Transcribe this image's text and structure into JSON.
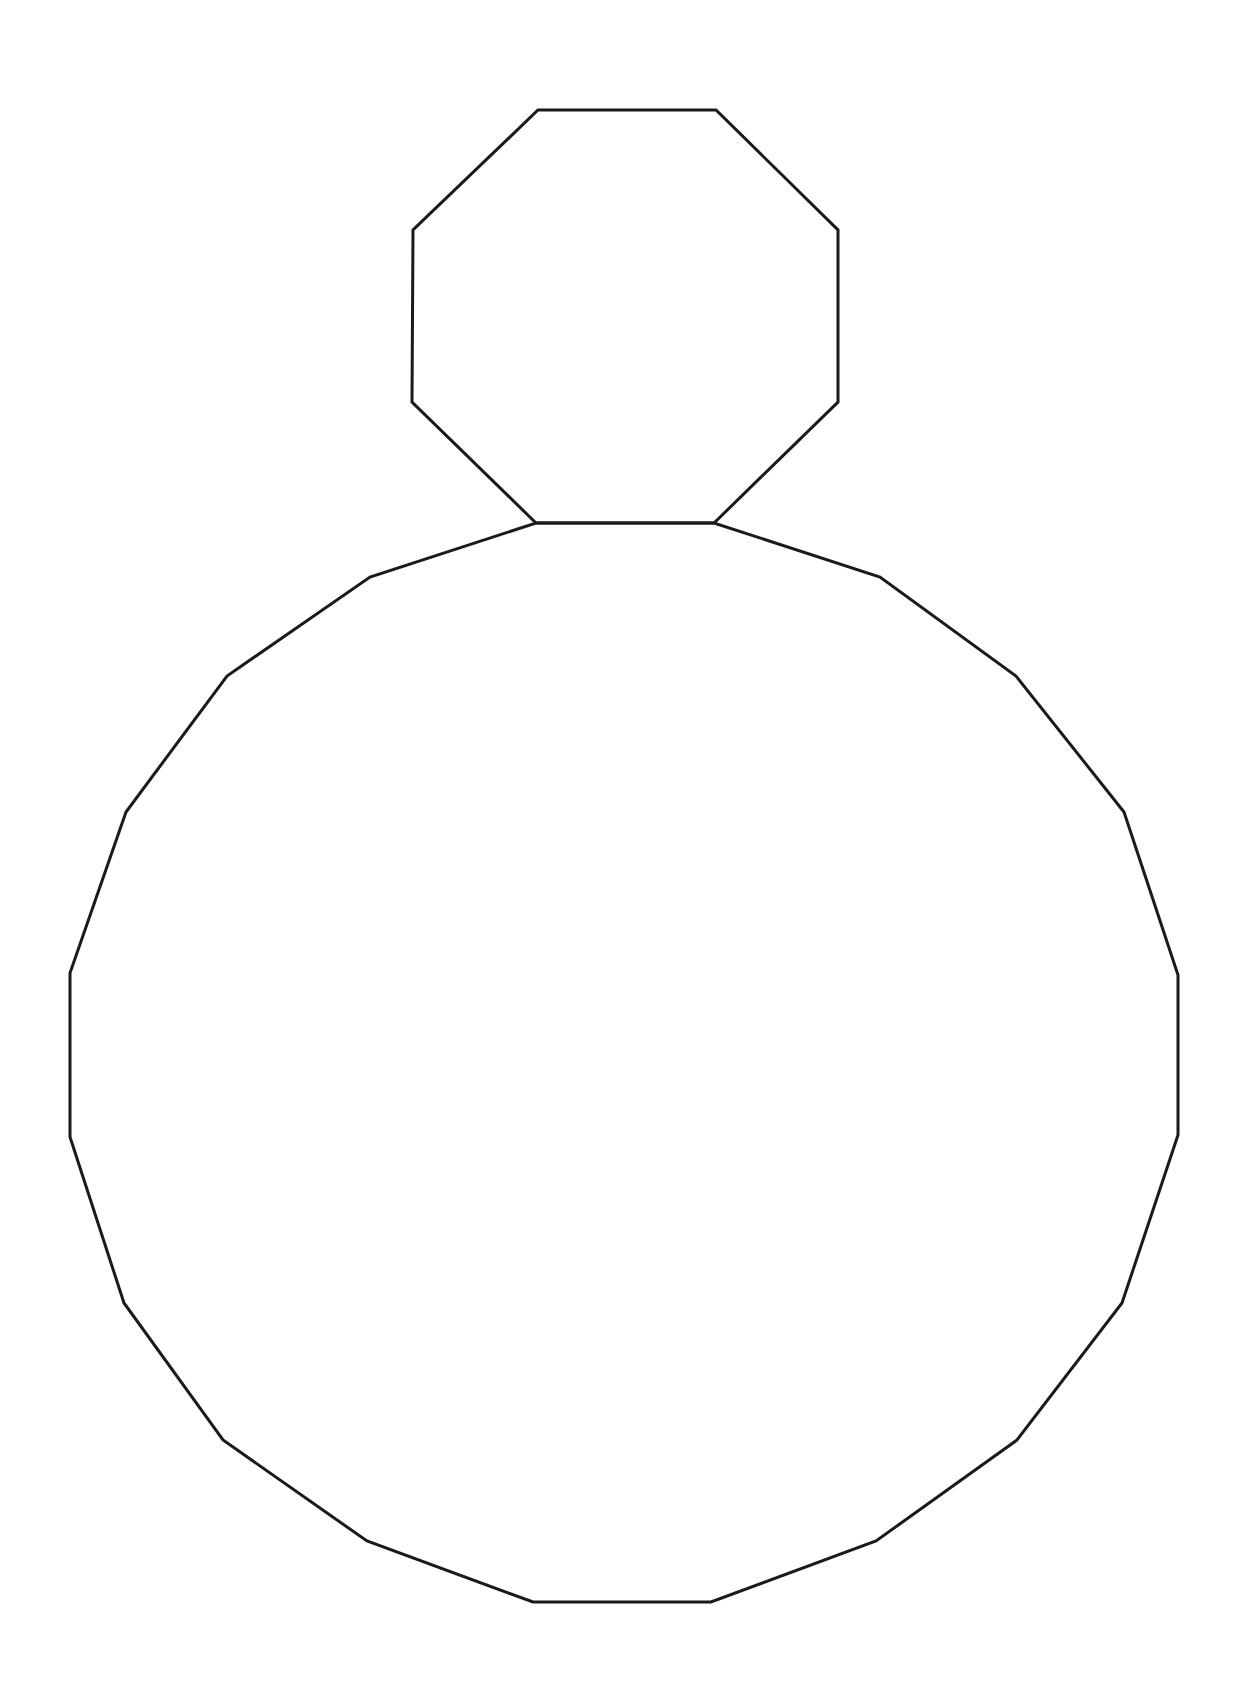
{
  "diagram": {
    "background": "#ffffff",
    "stroke_color": "#1a1a1a",
    "stroke_width": 3,
    "shapes": [
      {
        "name": "octagon",
        "sides": 8,
        "points": "538,110 716,110 838,230 838,402 714,523 536,523 412,402 413,230"
      },
      {
        "name": "icosagon",
        "sides": 20,
        "points": "536,523 714,523 880,577 1016,676 1124,812 1178,975 1178,1135 1122,1303 1017,1440 876,1541 711,1602 533,1602 367,1541 223,1440 124,1303 70,1137 70,973 126,812 227,676 370,577"
      }
    ]
  }
}
